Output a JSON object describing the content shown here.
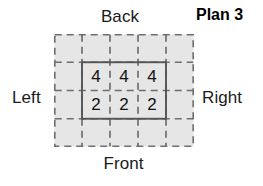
{
  "title": "Plan 3",
  "orientation": {
    "back": "Back",
    "front": "Front",
    "left": "Left",
    "right": "Right"
  },
  "grid": {
    "dashed_columns": 5,
    "dashed_rows": 4,
    "inner_columns": 3,
    "inner_rows": 2,
    "fill_color": "#e6e6e6",
    "dash_color": "#6e6e6e",
    "solid_color": "#555555"
  },
  "plan_values": {
    "rows": [
      [
        "4",
        "4",
        "4"
      ],
      [
        "2",
        "2",
        "2"
      ]
    ],
    "flat": [
      "4",
      "4",
      "4",
      "2",
      "2",
      "2"
    ]
  }
}
